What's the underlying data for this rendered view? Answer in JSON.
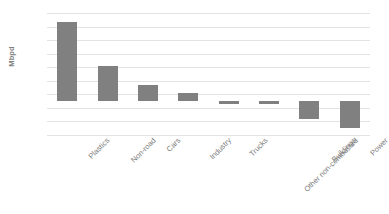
{
  "chart_data": {
    "type": "bar",
    "title": "",
    "subtitle": "",
    "xlabel": "",
    "ylabel": "Mbpd",
    "ylim": [
      -2.5,
      6.5
    ],
    "ytick_step": 1.0,
    "yticks": [
      6.5,
      5.5,
      4.5,
      3.5,
      2.5,
      1.5,
      0.5,
      -0.5,
      -1.5,
      -2.5
    ],
    "ytick_labels": [
      "6.5",
      "5.5",
      "4.5",
      "3.5",
      "2.5",
      "1.5",
      "0.5",
      "-0.5",
      "-1.5",
      "-2.5"
    ],
    "categories": [
      "Plastics",
      "Non-road",
      "Cars",
      "Industry",
      "Trucks",
      "Other non-combusted",
      "Buildings",
      "Power"
    ],
    "values": [
      5.8,
      2.6,
      1.2,
      0.6,
      -0.2,
      -0.25,
      -1.3,
      -2.0
    ],
    "series": [
      {
        "name": "",
        "values": [
          5.8,
          2.6,
          1.2,
          0.6,
          -0.2,
          -0.25,
          -1.3,
          -2.0
        ]
      }
    ],
    "bar_color": "#808080",
    "gridline_color": "#e3e3e3",
    "background_color": "#ffffff",
    "grid": true,
    "grid_axis": "y",
    "legend": false,
    "legend_position": "none",
    "label_rotation_deg": -45,
    "annotations": []
  }
}
